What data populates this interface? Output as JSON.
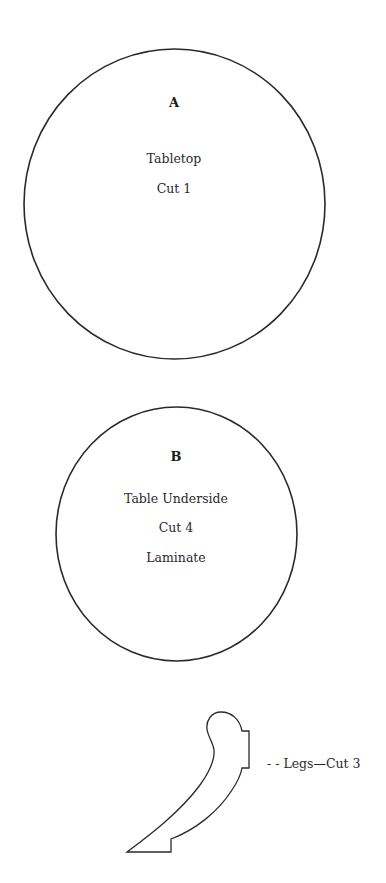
{
  "colors": {
    "background": "#ffffff",
    "outline": "#2a2a2a",
    "text": "#2a2a2a"
  },
  "pieces": [
    {
      "id": "A",
      "letter": "A",
      "name": "Tabletop",
      "cut": "Cut 1",
      "shape": "circle"
    },
    {
      "id": "B",
      "letter": "B",
      "name": "Table Underside",
      "cut": "Cut 4",
      "material": "Laminate",
      "shape": "circle"
    },
    {
      "id": "legs",
      "label": "- - Legs—Cut 3",
      "shape": "leg"
    }
  ]
}
